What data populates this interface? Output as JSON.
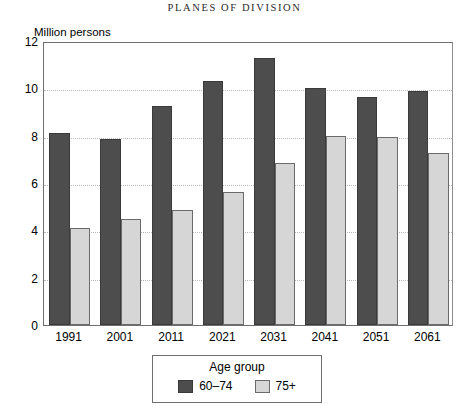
{
  "page": {
    "running_head": "PLANES OF DIVISION"
  },
  "chart_data": {
    "type": "bar",
    "title": "",
    "ylabel": "Million persons",
    "xlabel": "",
    "ylim": [
      0,
      12
    ],
    "yticks": [
      0,
      2,
      4,
      6,
      8,
      10,
      12
    ],
    "grid": true,
    "grid_axis": "y",
    "categories": [
      "1991",
      "2001",
      "2011",
      "2021",
      "2031",
      "2041",
      "2051",
      "2061"
    ],
    "series": [
      {
        "name": "60–74",
        "color": "#4d4d4d",
        "values": [
          8.1,
          7.85,
          9.25,
          10.3,
          11.3,
          10.0,
          9.65,
          9.9
        ]
      },
      {
        "name": "75+",
        "color": "#d6d6d6",
        "values": [
          4.1,
          4.5,
          4.85,
          5.6,
          6.85,
          8.0,
          7.95,
          7.25
        ]
      }
    ],
    "legend": {
      "title": "Age group",
      "position": "bottom",
      "entries": [
        "60–74",
        "75+"
      ]
    }
  }
}
